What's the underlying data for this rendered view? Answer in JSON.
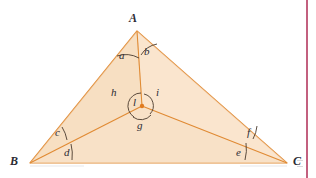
{
  "figure": {
    "canvas": {
      "width": 316,
      "height": 178,
      "background": "#ffffff"
    },
    "colors": {
      "fill": "#f9e2c8",
      "stroke": "#e08a33",
      "arc": "#4a3a2c",
      "label": "#2b2b33",
      "rule": "#c3607f",
      "incenter_dot": "#e07b20"
    },
    "vertices": [
      {
        "name": "A",
        "label": "A",
        "x": 137,
        "y": 31,
        "label_x": 131,
        "label_y": 13
      },
      {
        "name": "B",
        "label": "B",
        "x": 30,
        "y": 163,
        "label_x": 12,
        "label_y": 157
      },
      {
        "name": "C",
        "label": "C",
        "x": 287,
        "y": 163,
        "label_x": 294,
        "label_y": 157
      }
    ],
    "incenter": {
      "name": "I",
      "x": 142,
      "y": 106
    },
    "angle_labels": [
      {
        "id": "a",
        "label": "a",
        "x": 121,
        "y": 53,
        "vertex": "A",
        "side": "left"
      },
      {
        "id": "b",
        "label": "b",
        "x": 145,
        "y": 50,
        "vertex": "A",
        "side": "right"
      },
      {
        "id": "c",
        "label": "c",
        "x": 57,
        "y": 131,
        "vertex": "B",
        "side": "upper"
      },
      {
        "id": "d",
        "label": "d",
        "x": 66,
        "y": 150,
        "vertex": "B",
        "side": "lower"
      },
      {
        "id": "e",
        "label": "e",
        "x": 238,
        "y": 150,
        "vertex": "C",
        "side": "lower"
      },
      {
        "id": "f",
        "label": "f",
        "x": 248,
        "y": 131,
        "vertex": "C",
        "side": "upper"
      },
      {
        "id": "g",
        "label": "g",
        "x": 138,
        "y": 126,
        "vertex": "I",
        "side": "bottom"
      },
      {
        "id": "h",
        "label": "h",
        "x": 113,
        "y": 90,
        "vertex": "I",
        "side": "left"
      },
      {
        "id": "i",
        "label": "i",
        "x": 157,
        "y": 90,
        "vertex": "I",
        "side": "right"
      },
      {
        "id": "l",
        "label": "l",
        "x": 134,
        "y": 99,
        "vertex": "I",
        "side": "inside"
      }
    ],
    "rule": {
      "x": 306,
      "width": 2
    }
  }
}
